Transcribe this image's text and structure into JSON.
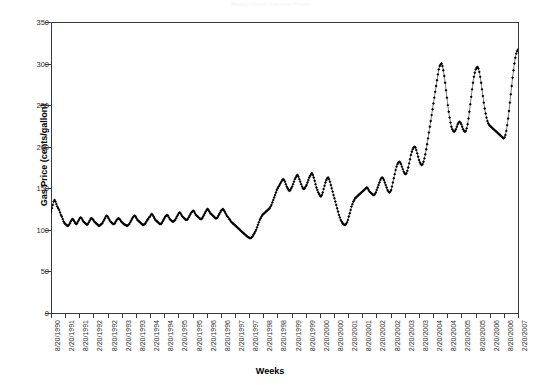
{
  "figure": {
    "faint_header": "Weekly Retail Gasoline Prices",
    "xlabel": "Weeks",
    "ylabel": "Gas Price (cents/gallon)"
  },
  "chart_data": {
    "type": "line",
    "title": "",
    "xlabel": "Weeks",
    "ylabel": "Gas Price (cents/gallon)",
    "ylim": [
      0,
      350
    ],
    "ytick_labels": [
      "0",
      "50",
      "100",
      "150",
      "200",
      "250",
      "300",
      "350"
    ],
    "yticks": [
      0,
      50,
      100,
      150,
      200,
      250,
      300,
      350
    ],
    "grid": false,
    "legend": "none",
    "marker": "filled-diamond",
    "line_color": "#000000",
    "xtick_labels": [
      "8/20/1990",
      "2/20/1991",
      "8/20/1991",
      "2/20/1992",
      "8/20/1992",
      "2/20/1993",
      "8/20/1993",
      "2/20/1994",
      "8/20/1994",
      "2/20/1995",
      "8/20/1995",
      "2/20/1996",
      "8/20/1996",
      "2/20/1997",
      "8/20/1997",
      "2/20/1998",
      "8/20/1998",
      "2/20/1999",
      "8/20/1999",
      "2/20/2000",
      "8/20/2000",
      "2/20/2001",
      "8/20/2001",
      "2/20/2002",
      "8/20/2002",
      "2/20/2003",
      "8/20/2003",
      "2/20/2004",
      "8/20/2004",
      "2/20/2005",
      "8/20/2005",
      "2/20/2006",
      "8/20/2006",
      "2/20/2007"
    ],
    "x_start": "8/20/1990",
    "x_end": "2/20/2007",
    "x_interval": "weekly",
    "values": [
      122,
      126,
      130,
      134,
      136,
      134,
      131,
      128,
      126,
      124,
      121,
      118,
      116,
      113,
      110,
      108,
      107,
      106,
      105,
      105,
      106,
      108,
      110,
      112,
      113,
      112,
      110,
      108,
      107,
      108,
      110,
      112,
      114,
      115,
      114,
      112,
      110,
      109,
      108,
      107,
      106,
      107,
      109,
      111,
      113,
      114,
      113,
      112,
      110,
      109,
      108,
      107,
      106,
      105,
      105,
      106,
      107,
      108,
      110,
      112,
      114,
      116,
      117,
      116,
      114,
      112,
      110,
      109,
      108,
      107,
      107,
      108,
      110,
      112,
      113,
      114,
      113,
      112,
      110,
      109,
      108,
      107,
      106,
      106,
      105,
      105,
      106,
      107,
      109,
      111,
      113,
      115,
      116,
      117,
      116,
      114,
      112,
      111,
      110,
      109,
      108,
      107,
      106,
      106,
      107,
      108,
      110,
      112,
      113,
      115,
      116,
      118,
      119,
      118,
      116,
      114,
      112,
      111,
      110,
      109,
      108,
      107,
      107,
      108,
      110,
      112,
      114,
      116,
      117,
      118,
      117,
      115,
      113,
      112,
      111,
      110,
      110,
      111,
      112,
      114,
      116,
      118,
      120,
      121,
      120,
      118,
      116,
      115,
      114,
      113,
      112,
      112,
      113,
      115,
      117,
      119,
      121,
      122,
      123,
      122,
      120,
      118,
      117,
      116,
      115,
      114,
      113,
      113,
      114,
      116,
      118,
      120,
      122,
      124,
      125,
      124,
      122,
      120,
      119,
      118,
      117,
      116,
      115,
      114,
      114,
      115,
      117,
      119,
      121,
      123,
      124,
      125,
      124,
      122,
      120,
      118,
      116,
      115,
      113,
      112,
      110,
      109,
      108,
      107,
      106,
      105,
      104,
      103,
      102,
      101,
      100,
      99,
      98,
      97,
      96,
      95,
      94,
      93,
      92,
      91,
      91,
      90,
      90,
      91,
      92,
      94,
      96,
      98,
      100,
      103,
      106,
      109,
      112,
      114,
      116,
      118,
      119,
      120,
      121,
      122,
      123,
      124,
      125,
      126,
      128,
      130,
      133,
      136,
      139,
      142,
      145,
      148,
      150,
      152,
      154,
      156,
      158,
      160,
      161,
      160,
      158,
      155,
      152,
      150,
      148,
      147,
      148,
      150,
      152,
      155,
      158,
      161,
      163,
      165,
      166,
      164,
      161,
      158,
      155,
      152,
      150,
      149,
      150,
      152,
      154,
      157,
      160,
      163,
      165,
      167,
      168,
      166,
      163,
      159,
      155,
      151,
      148,
      145,
      143,
      141,
      140,
      142,
      145,
      149,
      153,
      157,
      160,
      162,
      163,
      161,
      158,
      154,
      150,
      146,
      142,
      138,
      134,
      130,
      126,
      122,
      118,
      115,
      112,
      110,
      108,
      107,
      106,
      106,
      107,
      109,
      112,
      116,
      120,
      124,
      128,
      131,
      134,
      136,
      138,
      139,
      140,
      141,
      142,
      143,
      144,
      145,
      146,
      147,
      148,
      149,
      150,
      151,
      150,
      148,
      146,
      145,
      144,
      143,
      142,
      142,
      143,
      145,
      148,
      151,
      154,
      157,
      160,
      162,
      163,
      162,
      160,
      157,
      154,
      151,
      148,
      146,
      145,
      146,
      148,
      152,
      157,
      162,
      167,
      172,
      176,
      179,
      181,
      182,
      181,
      179,
      176,
      173,
      170,
      168,
      167,
      168,
      171,
      175,
      180,
      185,
      190,
      194,
      197,
      199,
      200,
      199,
      196,
      192,
      188,
      184,
      181,
      179,
      178,
      179,
      182,
      186,
      191,
      197,
      203,
      210,
      217,
      224,
      231,
      238,
      245,
      252,
      259,
      266,
      273,
      280,
      287,
      293,
      297,
      299,
      300,
      297,
      292,
      285,
      277,
      268,
      259,
      250,
      242,
      235,
      229,
      224,
      221,
      219,
      218,
      219,
      221,
      224,
      227,
      229,
      230,
      229,
      227,
      224,
      221,
      219,
      218,
      219,
      222,
      227,
      234,
      242,
      251,
      260,
      269,
      277,
      284,
      289,
      293,
      295,
      296,
      294,
      290,
      284,
      277,
      269,
      261,
      253,
      246,
      240,
      235,
      231,
      228,
      226,
      225,
      224,
      223,
      222,
      221,
      220,
      219,
      218,
      217,
      216,
      215,
      214,
      213,
      212,
      211,
      210,
      211,
      214,
      219,
      226,
      234,
      243,
      253,
      263,
      273,
      283,
      292,
      300,
      307,
      312,
      315,
      317
    ],
    "annotations": {
      "series_min": 90,
      "series_min_period": "early 1999",
      "series_max": 317,
      "series_max_period": "2/20/2007",
      "peak_2005": 300,
      "peak_2006": 296,
      "trough_2002": 106
    }
  }
}
